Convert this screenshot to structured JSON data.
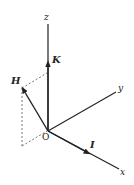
{
  "diagram": {
    "type": "3d-coordinate-axes",
    "colors": {
      "line": "#222222",
      "dashed": "#555555",
      "background": "#ffffff"
    },
    "axes": {
      "z": {
        "label": "z"
      },
      "y": {
        "label": "y"
      },
      "x": {
        "label": "x"
      }
    },
    "origin": {
      "label": "O"
    },
    "vectors": [
      {
        "name": "K",
        "label": "K",
        "along": "z"
      },
      {
        "name": "H",
        "label": "H",
        "along": "xz-plane"
      },
      {
        "name": "I",
        "label": "I",
        "along": "x"
      }
    ]
  }
}
